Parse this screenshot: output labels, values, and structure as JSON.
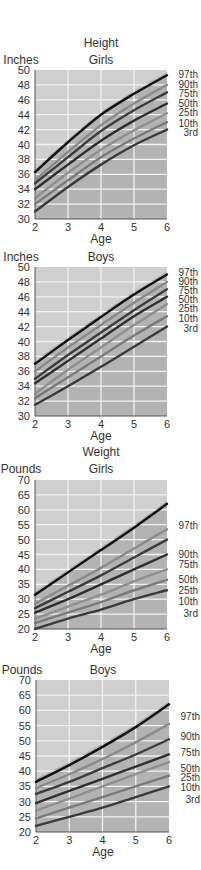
{
  "chart_data": [
    {
      "type": "line",
      "section_title": "Height",
      "title": "Girls",
      "ylabel": "Inches",
      "xlabel": "Age",
      "x": [
        2,
        3,
        4,
        5,
        6
      ],
      "xlim": [
        2,
        6
      ],
      "ylim": [
        30,
        50
      ],
      "yticks": [
        30,
        32,
        34,
        36,
        38,
        40,
        42,
        44,
        46,
        48,
        50
      ],
      "xticks": [
        2,
        3,
        4,
        5,
        6
      ],
      "grid": true,
      "legend_position": "right (inline labels at line ends)",
      "series": [
        {
          "name": "97th",
          "values": [
            36.3,
            40.3,
            44.0,
            46.8,
            49.3
          ]
        },
        {
          "name": "90th",
          "values": [
            35.2,
            39.0,
            42.6,
            45.5,
            48.0
          ]
        },
        {
          "name": "75th",
          "values": [
            34.8,
            38.3,
            41.8,
            44.6,
            47.0
          ]
        },
        {
          "name": "50th",
          "values": [
            34.0,
            37.3,
            40.5,
            43.2,
            45.5
          ]
        },
        {
          "name": "25th",
          "values": [
            32.8,
            36.2,
            39.3,
            41.9,
            44.2
          ]
        },
        {
          "name": "10th",
          "values": [
            32.0,
            35.2,
            38.3,
            40.8,
            43.0
          ]
        },
        {
          "name": "3rd",
          "values": [
            31.0,
            34.3,
            37.3,
            39.9,
            42.0
          ]
        }
      ]
    },
    {
      "type": "line",
      "title": "Boys",
      "ylabel": "Inches",
      "xlabel": "Age",
      "x": [
        2,
        3,
        4,
        5,
        6
      ],
      "xlim": [
        2,
        6
      ],
      "ylim": [
        30,
        50
      ],
      "yticks": [
        30,
        32,
        34,
        36,
        38,
        40,
        42,
        44,
        46,
        48,
        50
      ],
      "xticks": [
        2,
        3,
        4,
        5,
        6
      ],
      "grid": true,
      "legend_position": "right (inline labels at line ends)",
      "series": [
        {
          "name": "97th",
          "values": [
            37.0,
            40.2,
            43.3,
            46.3,
            49.0
          ]
        },
        {
          "name": "90th",
          "values": [
            36.0,
            39.2,
            42.2,
            45.2,
            48.0
          ]
        },
        {
          "name": "75th",
          "values": [
            35.0,
            38.2,
            41.2,
            44.2,
            47.0
          ]
        },
        {
          "name": "50th",
          "values": [
            34.4,
            37.4,
            40.4,
            43.4,
            46.0
          ]
        },
        {
          "name": "25th",
          "values": [
            33.0,
            36.2,
            39.2,
            42.2,
            45.0
          ]
        },
        {
          "name": "10th",
          "values": [
            32.4,
            35.2,
            38.0,
            40.8,
            43.4
          ]
        },
        {
          "name": "3rd",
          "values": [
            31.5,
            34.0,
            36.6,
            39.3,
            42.0
          ]
        }
      ]
    },
    {
      "type": "line",
      "section_title": "Weight",
      "title": "Girls",
      "ylabel": "Pounds",
      "xlabel": "Age",
      "x": [
        2,
        3,
        4,
        5,
        6
      ],
      "xlim": [
        2,
        6
      ],
      "ylim": [
        20,
        70
      ],
      "yticks": [
        20,
        25,
        30,
        35,
        40,
        45,
        50,
        55,
        60,
        65,
        70
      ],
      "xticks": [
        2,
        3,
        4,
        5,
        6
      ],
      "grid": true,
      "legend_position": "right (inline labels at line ends)",
      "series": [
        {
          "name": "97th",
          "values": [
            31.5,
            39.0,
            46.5,
            54.0,
            62.0
          ]
        },
        {
          "name": "90th",
          "values": [
            28.5,
            34.5,
            40.5,
            47.0,
            53.5
          ]
        },
        {
          "name": "75th",
          "values": [
            27.0,
            32.5,
            38.0,
            44.0,
            50.0
          ]
        },
        {
          "name": "50th",
          "values": [
            25.5,
            30.0,
            35.0,
            40.0,
            45.0
          ]
        },
        {
          "name": "25th",
          "values": [
            23.5,
            27.5,
            31.5,
            36.0,
            40.0
          ]
        },
        {
          "name": "10th",
          "values": [
            22.0,
            25.5,
            29.0,
            33.0,
            36.5
          ]
        },
        {
          "name": "3rd",
          "values": [
            20.0,
            23.5,
            26.5,
            30.0,
            33.0
          ]
        }
      ]
    },
    {
      "type": "line",
      "title": "Boys",
      "ylabel": "Pounds",
      "xlabel": "Age",
      "x": [
        2,
        3,
        4,
        5,
        6
      ],
      "xlim": [
        2,
        6
      ],
      "ylim": [
        20,
        70
      ],
      "yticks": [
        20,
        25,
        30,
        35,
        40,
        45,
        50,
        55,
        60,
        65,
        70
      ],
      "xticks": [
        2,
        3,
        4,
        5,
        6
      ],
      "grid": true,
      "legend_position": "right (inline labels at line ends)",
      "series": [
        {
          "name": "97th",
          "values": [
            36.5,
            42.0,
            48.0,
            54.5,
            62.0
          ]
        },
        {
          "name": "90th",
          "values": [
            34.5,
            39.0,
            44.0,
            49.5,
            55.5
          ]
        },
        {
          "name": "75th",
          "values": [
            32.5,
            36.5,
            41.0,
            45.5,
            50.5
          ]
        },
        {
          "name": "50th",
          "values": [
            29.5,
            33.5,
            37.5,
            41.5,
            45.5
          ]
        },
        {
          "name": "25th",
          "values": [
            27.0,
            31.0,
            35.0,
            39.0,
            43.0
          ]
        },
        {
          "name": "10th",
          "values": [
            24.5,
            28.0,
            31.5,
            35.0,
            38.5
          ]
        },
        {
          "name": "3rd",
          "values": [
            22.0,
            25.0,
            28.0,
            31.5,
            35.0
          ]
        }
      ]
    }
  ],
  "labels": {
    "height_title": "Height",
    "weight_title": "Weight",
    "inches": "Inches",
    "pounds": "Pounds",
    "girls": "Girls",
    "boys": "Boys",
    "age": "Age"
  },
  "colors": {
    "plot_bg_light": "#cfcfcf",
    "plot_bg_dark": "#a9a9a9",
    "grid": "#f2f2f2",
    "line_97": "#111111",
    "line_90": "#8a8a8a",
    "line_75": "#3c3c3c",
    "line_50": "#2e2e2e",
    "line_25": "#8f8f8f",
    "line_10": "#7a7a7a",
    "line_3": "#3a3a3a"
  }
}
